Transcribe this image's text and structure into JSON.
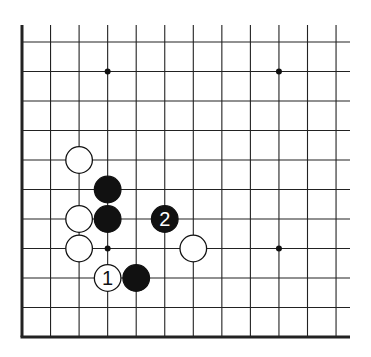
{
  "diagram": {
    "type": "go-board-fragment",
    "corner": "bottom-left",
    "columns_visible": 12,
    "rows_visible": 11,
    "colors": {
      "black": "#111111",
      "white": "#ffffff",
      "line": "#222222",
      "background": "#ffffff"
    },
    "star_points": [
      {
        "col": 3,
        "row": 1
      },
      {
        "col": 9,
        "row": 1
      },
      {
        "col": 3,
        "row": 7
      },
      {
        "col": 9,
        "row": 7
      }
    ],
    "stones": [
      {
        "color": "white",
        "col": 2,
        "row": 4,
        "label": ""
      },
      {
        "color": "black",
        "col": 3,
        "row": 5,
        "label": ""
      },
      {
        "color": "white",
        "col": 2,
        "row": 6,
        "label": ""
      },
      {
        "color": "black",
        "col": 3,
        "row": 6,
        "label": ""
      },
      {
        "color": "black",
        "col": 5,
        "row": 6,
        "label": "2"
      },
      {
        "color": "white",
        "col": 2,
        "row": 7,
        "label": ""
      },
      {
        "color": "white",
        "col": 6,
        "row": 7,
        "label": ""
      },
      {
        "color": "white",
        "col": 3,
        "row": 8,
        "label": "1"
      },
      {
        "color": "black",
        "col": 4,
        "row": 8,
        "label": ""
      }
    ]
  }
}
